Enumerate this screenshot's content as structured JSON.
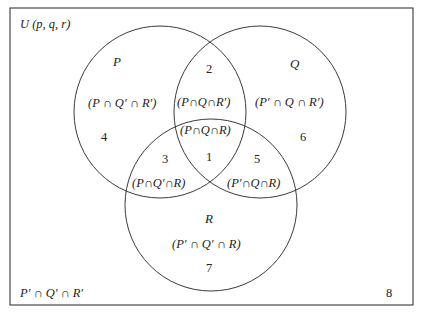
{
  "diagram": {
    "type": "venn",
    "universe_label": "U (p, q, r)",
    "colors": {
      "stroke": "#3a3a3a",
      "text": "#222222",
      "background": "#ffffff"
    },
    "sets": [
      {
        "name": "P",
        "label": "P"
      },
      {
        "name": "Q",
        "label": "Q"
      },
      {
        "name": "R",
        "label": "R"
      }
    ],
    "regions": [
      {
        "number": "1",
        "expression": "(P∩Q∩R)"
      },
      {
        "number": "2",
        "expression": "(P∩Q∩R′)"
      },
      {
        "number": "3",
        "expression": "(P∩Q′∩R)"
      },
      {
        "number": "4",
        "expression": "(P ∩ Q′ ∩ R′)"
      },
      {
        "number": "5",
        "expression": "(P′∩Q∩R)"
      },
      {
        "number": "6",
        "expression": "(P′ ∩ Q ∩ R′)"
      },
      {
        "number": "7",
        "expression": "(P′ ∩ Q′ ∩ R)"
      },
      {
        "number": "8",
        "expression": "P′ ∩ Q′ ∩ R′"
      }
    ]
  }
}
